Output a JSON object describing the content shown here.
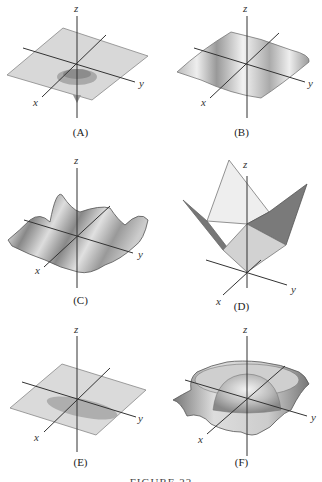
{
  "figure": {
    "caption": "FIGURE 22",
    "panels": [
      {
        "id": "A",
        "label": "(A)",
        "axes": {
          "x": "x",
          "y": "y",
          "z": "z"
        },
        "description": "flat plane with a small downward spike/dip near origin"
      },
      {
        "id": "B",
        "label": "(B)",
        "axes": {
          "x": "x",
          "y": "y",
          "z": "z"
        },
        "description": "surface with ripples (waves) along one direction"
      },
      {
        "id": "C",
        "label": "(C)",
        "axes": {
          "x": "x",
          "y": "y",
          "z": "z"
        },
        "description": "oscillating wavy surface in two directions"
      },
      {
        "id": "D",
        "label": "(D)",
        "axes": {
          "x": "x",
          "y": "y",
          "z": "z"
        },
        "description": "piecewise-planar V-shaped surface (folded planes)"
      },
      {
        "id": "E",
        "label": "(E)",
        "axes": {
          "x": "x",
          "y": "y",
          "z": "z"
        },
        "description": "flat plane with a shallow elongated dip"
      },
      {
        "id": "F",
        "label": "(F)",
        "axes": {
          "x": "x",
          "y": "y",
          "z": "z"
        },
        "description": "radially symmetric ripple with central bump (sombrero-like)"
      }
    ]
  }
}
